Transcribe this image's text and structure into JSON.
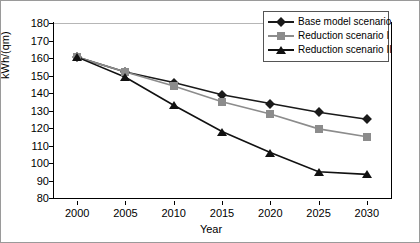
{
  "chart_data": {
    "type": "line",
    "title": "",
    "xlabel": "Year",
    "ylabel": "kWh/(qm)",
    "x": [
      2000,
      2005,
      2010,
      2015,
      2020,
      2025,
      2030
    ],
    "xticklabels": [
      "2000",
      "2005",
      "2010",
      "2015",
      "2020",
      "2025",
      "2030"
    ],
    "xlim": [
      1997.5,
      2032.5
    ],
    "ylim": [
      80,
      180
    ],
    "yticks": [
      80,
      90,
      100,
      110,
      120,
      130,
      140,
      150,
      160,
      170,
      180
    ],
    "yticklabels": [
      "80",
      "90",
      "100",
      "110",
      "120",
      "130",
      "140",
      "150",
      "160",
      "170",
      "180"
    ],
    "grid": false,
    "legend_position": "top-right",
    "series": [
      {
        "name": "Base model scenario",
        "marker": "diamond",
        "color": "#1a1a1a",
        "line_color": "#1a1a1a",
        "values": [
          160.5,
          152,
          146,
          139,
          134,
          129,
          125
        ]
      },
      {
        "name": "Reduction scenario I",
        "marker": "square",
        "color": "#8c8c8c",
        "line_color": "#8c8c8c",
        "values": [
          160.5,
          152,
          144,
          135,
          128,
          119.5,
          115
        ]
      },
      {
        "name": "Reduction scenario II",
        "marker": "triangle",
        "color": "#111111",
        "line_color": "#111111",
        "values": [
          160.5,
          149,
          133,
          118,
          106,
          95,
          93.5
        ]
      }
    ]
  }
}
